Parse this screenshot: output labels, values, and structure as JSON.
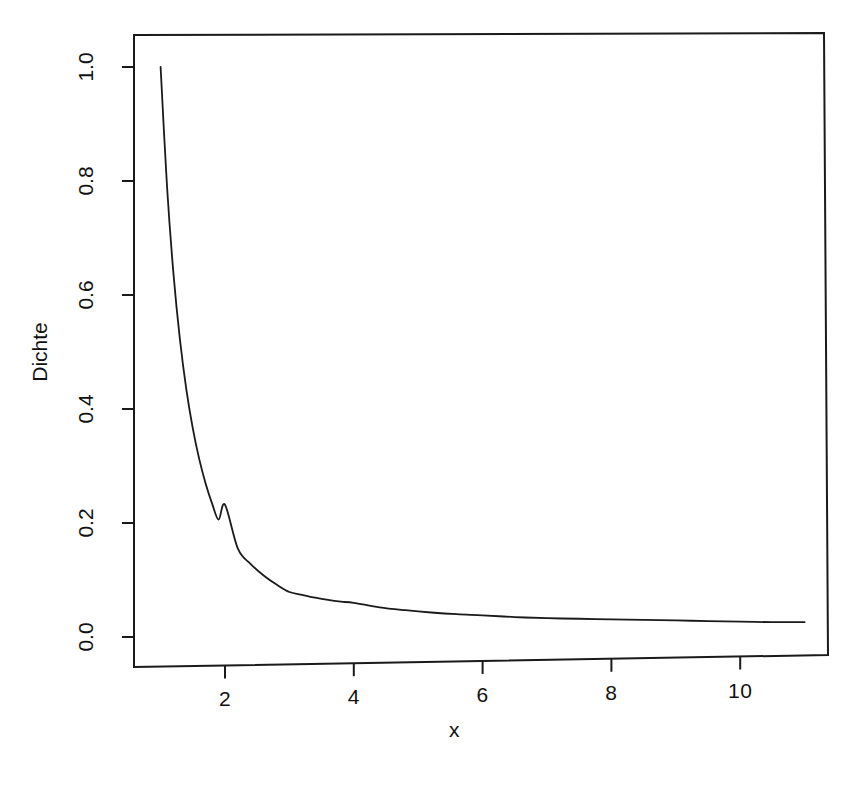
{
  "chart_data": {
    "type": "line",
    "title": "",
    "xlabel": "x",
    "ylabel": "Dichte",
    "xlim": [
      0.9,
      11.0
    ],
    "ylim": [
      0.0,
      1.05
    ],
    "xticks": [
      2,
      4,
      6,
      8,
      10
    ],
    "xtick_labels": [
      "2",
      "4",
      "6",
      "8",
      "10"
    ],
    "yticks": [
      0.0,
      0.2,
      0.4,
      0.6,
      0.8,
      1.0
    ],
    "ytick_labels": [
      "0.0",
      "0.2",
      "0.4",
      "0.6",
      "0.8",
      "1.0"
    ],
    "grid": false,
    "legend": "none",
    "box": true,
    "line_color": "#1a1a1a",
    "line_width": 1.6,
    "series": [
      {
        "name": "Dichte",
        "x": [
          1.0,
          1.1,
          1.2,
          1.3,
          1.4,
          1.5,
          1.6,
          1.7,
          1.8,
          1.9,
          2.0,
          2.2,
          2.4,
          2.6,
          2.8,
          3.0,
          3.2,
          3.4,
          3.6,
          3.8,
          4.0,
          4.4,
          4.8,
          5.2,
          5.6,
          6.0,
          6.5,
          7.0,
          7.5,
          8.0,
          8.5,
          9.0,
          9.5,
          10.0,
          10.5,
          11.0
        ],
        "y": [
          1.0,
          0.79,
          0.637,
          0.522,
          0.434,
          0.366,
          0.312,
          0.269,
          0.234,
          0.206,
          0.232,
          0.155,
          0.128,
          0.108,
          0.092,
          0.079,
          0.074,
          0.069,
          0.065,
          0.062,
          0.06,
          0.052,
          0.047,
          0.043,
          0.04,
          0.038,
          0.035,
          0.033,
          0.032,
          0.031,
          0.03,
          0.029,
          0.028,
          0.027,
          0.026,
          0.026
        ]
      }
    ]
  },
  "axes": {
    "x_title": "x",
    "y_title": "Dichte"
  },
  "header": {
    "title": ""
  }
}
